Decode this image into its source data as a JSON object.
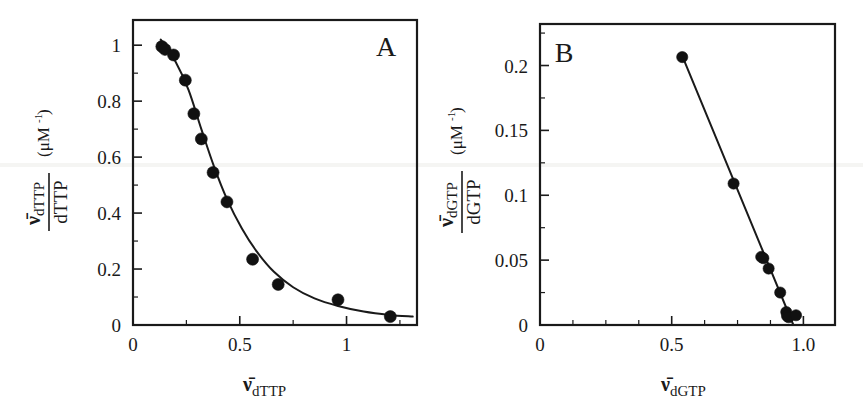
{
  "figure": {
    "background": "#ffffff",
    "ink_color": "#1a1a1a",
    "marker_color": "#111111",
    "panel_a_label": "A",
    "panel_b_label": "B"
  },
  "chart_data": [
    {
      "type": "scatter",
      "panel": "A",
      "title": "",
      "xlabel": "v̄dTTP",
      "xlabel_var": "ν̄",
      "xlabel_sub": "dTTP",
      "ylabel_numer_var": "ν̄",
      "ylabel_numer_sub": "dTTP",
      "ylabel_denom": "dTTP",
      "ylabel_units": "(μM",
      "ylabel_units_sup": "-1",
      "ylabel_units_close": ")",
      "xlim": [
        0,
        1.33
      ],
      "ylim": [
        0,
        1.09
      ],
      "xticks": [
        0,
        0.5,
        1
      ],
      "xtick_labels": [
        "0",
        "0.5",
        "1"
      ],
      "xminor": [
        0.25,
        0.75,
        1.25
      ],
      "yticks": [
        0,
        0.2,
        0.4,
        0.6,
        0.8,
        1
      ],
      "ytick_labels": [
        "0",
        "0.2",
        "0.4",
        "0.6",
        "0.8",
        "1"
      ],
      "yminor": [
        0.1,
        0.3,
        0.5,
        0.7,
        0.9
      ],
      "grid": false,
      "legend": "none",
      "points": [
        {
          "x": 0.135,
          "y": 0.995
        },
        {
          "x": 0.15,
          "y": 0.985
        },
        {
          "x": 0.19,
          "y": 0.965
        },
        {
          "x": 0.245,
          "y": 0.875
        },
        {
          "x": 0.285,
          "y": 0.755
        },
        {
          "x": 0.32,
          "y": 0.665
        },
        {
          "x": 0.375,
          "y": 0.545
        },
        {
          "x": 0.44,
          "y": 0.44
        },
        {
          "x": 0.56,
          "y": 0.235
        },
        {
          "x": 0.68,
          "y": 0.145
        },
        {
          "x": 0.96,
          "y": 0.09
        },
        {
          "x": 1.205,
          "y": 0.03
        }
      ],
      "fit_curve": [
        {
          "x": 0.13,
          "y": 1.02
        },
        {
          "x": 0.2,
          "y": 0.94
        },
        {
          "x": 0.26,
          "y": 0.84
        },
        {
          "x": 0.32,
          "y": 0.7
        },
        {
          "x": 0.38,
          "y": 0.565
        },
        {
          "x": 0.44,
          "y": 0.45
        },
        {
          "x": 0.51,
          "y": 0.345
        },
        {
          "x": 0.58,
          "y": 0.262
        },
        {
          "x": 0.66,
          "y": 0.19
        },
        {
          "x": 0.75,
          "y": 0.135
        },
        {
          "x": 0.85,
          "y": 0.095
        },
        {
          "x": 0.96,
          "y": 0.068
        },
        {
          "x": 1.08,
          "y": 0.048
        },
        {
          "x": 1.2,
          "y": 0.036
        },
        {
          "x": 1.31,
          "y": 0.03
        }
      ]
    },
    {
      "type": "scatter",
      "panel": "B",
      "title": "",
      "xlabel": "v̄dGTP",
      "xlabel_var": "ν̄",
      "xlabel_sub": "dGTP",
      "ylabel_numer_var": "ν̄",
      "ylabel_numer_sub": "dGTP",
      "ylabel_denom": "dGTP",
      "ylabel_units": "(μM",
      "ylabel_units_sup": "-1",
      "ylabel_units_close": ")",
      "xlim": [
        0,
        1.12
      ],
      "ylim": [
        0,
        0.232
      ],
      "xticks": [
        0,
        0.5,
        1.0
      ],
      "xtick_labels": [
        "0",
        "0.5",
        "1.0"
      ],
      "xminor": [
        0.125,
        0.25,
        0.375,
        0.625,
        0.75,
        0.875
      ],
      "yticks": [
        0,
        0.05,
        0.1,
        0.15,
        0.2
      ],
      "ytick_labels": [
        "0",
        "0.05",
        "0.1",
        "0.15",
        "0.2"
      ],
      "yminor": [
        0.025,
        0.075,
        0.125,
        0.175,
        0.225
      ],
      "grid": false,
      "legend": "none",
      "points": [
        {
          "x": 0.54,
          "y": 0.2065
        },
        {
          "x": 0.735,
          "y": 0.109
        },
        {
          "x": 0.84,
          "y": 0.0525
        },
        {
          "x": 0.848,
          "y": 0.0515
        },
        {
          "x": 0.868,
          "y": 0.0435
        },
        {
          "x": 0.912,
          "y": 0.025
        },
        {
          "x": 0.935,
          "y": 0.01
        },
        {
          "x": 0.938,
          "y": 0.007
        },
        {
          "x": 0.944,
          "y": 0.006
        },
        {
          "x": 0.972,
          "y": 0.0075
        }
      ],
      "fit_line": {
        "x0": 0.54,
        "y0": 0.2075,
        "x1": 0.962,
        "y1": 0.0
      }
    }
  ]
}
